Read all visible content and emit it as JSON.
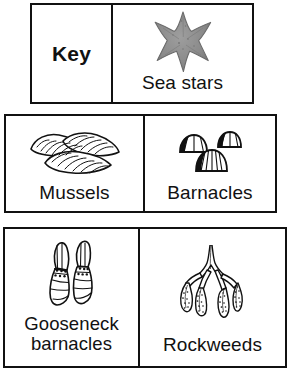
{
  "figure": {
    "name": "intertidal-organisms-key",
    "key_label": "Key",
    "rows": [
      {
        "cells": [
          {
            "type": "key-title",
            "label": "Key",
            "icon": null
          },
          {
            "type": "entry",
            "label": "Sea stars",
            "icon": "sea-star-icon",
            "color": "#8a8a8a"
          }
        ]
      },
      {
        "cells": [
          {
            "type": "entry",
            "label": "Mussels",
            "icon": "mussels-icon",
            "color": "#111111"
          },
          {
            "type": "entry",
            "label": "Barnacles",
            "icon": "barnacles-icon",
            "color": "#111111"
          }
        ]
      },
      {
        "cells": [
          {
            "type": "entry",
            "label": "Gooseneck barnacles",
            "label_line1": "Gooseneck",
            "label_line2": "barnacles",
            "icon": "gooseneck-barnacles-icon",
            "color": "#111111"
          },
          {
            "type": "entry",
            "label": "Rockweeds",
            "icon": "rockweeds-icon",
            "color": "#111111"
          }
        ]
      }
    ],
    "colors": {
      "border": "#111111",
      "background": "#ffffff",
      "text": "#111111",
      "sea_star_fill": "#8a8a8a"
    }
  }
}
